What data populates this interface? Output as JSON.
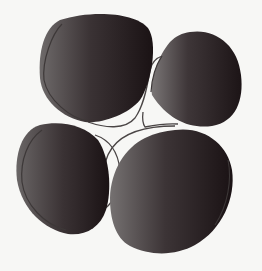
{
  "image": {
    "width": 262,
    "height": 271,
    "background": "#f7f7f5",
    "description": "Four dark rounded pebble-like shapes joined by thin crossing lines"
  },
  "colors": {
    "shape_dark": "#1c1416",
    "shape_mid": "#3a3234",
    "shape_light": "#6e6a6a",
    "outline": "#3d3838",
    "line": "#4a4545"
  },
  "shapes": [
    {
      "id": "top-left",
      "label": "pebble-top-left"
    },
    {
      "id": "top-right",
      "label": "pebble-top-right"
    },
    {
      "id": "bottom-left",
      "label": "pebble-bottom-left"
    },
    {
      "id": "bottom-right",
      "label": "pebble-bottom-right"
    }
  ]
}
